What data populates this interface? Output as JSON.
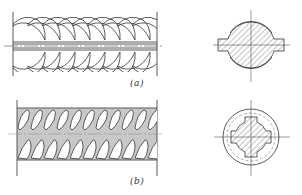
{
  "figure": {
    "colors": {
      "line": "#333333",
      "fill_b": "#c8c8c8",
      "hatch": "#555555",
      "background": "#ffffff"
    },
    "panels": [
      {
        "id": "a",
        "label": "(a)",
        "side_view": "crescent-ribbed bar with longitudinal ribs",
        "cross_section": "circular section with two longitudinal rib tabs, hatched"
      },
      {
        "id": "b",
        "label": "(b)",
        "side_view": "helical/inclined-ribbed bar, shaded",
        "cross_section": "circular core with four notches inside outer ring, hatched"
      }
    ]
  }
}
